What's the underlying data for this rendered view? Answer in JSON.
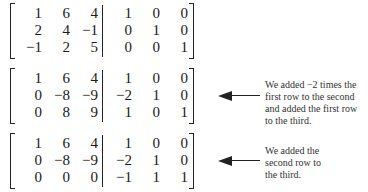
{
  "figure": {
    "matrices": [
      {
        "rows": [
          [
            "1",
            "6",
            "4",
            "1",
            "0",
            "0"
          ],
          [
            "2",
            "4",
            "−1",
            "0",
            "1",
            "0"
          ],
          [
            "−1",
            "2",
            "5",
            "0",
            "0",
            "1"
          ]
        ],
        "annotation": null
      },
      {
        "rows": [
          [
            "1",
            "6",
            "4",
            "1",
            "0",
            "0"
          ],
          [
            "0",
            "−8",
            "−9",
            "−2",
            "1",
            "0"
          ],
          [
            "0",
            "8",
            "9",
            "1",
            "0",
            "1"
          ]
        ],
        "annotation": "We added −2 times the first row to the second and added the first row to the third."
      },
      {
        "rows": [
          [
            "1",
            "6",
            "4",
            "1",
            "0",
            "0"
          ],
          [
            "0",
            "−8",
            "−9",
            "−2",
            "1",
            "0"
          ],
          [
            "0",
            "0",
            "0",
            "−1",
            "1",
            "1"
          ]
        ],
        "annotation": "We added the second row to the third."
      }
    ],
    "icons": {
      "annotation_arrow": "left-arrow-icon"
    }
  }
}
